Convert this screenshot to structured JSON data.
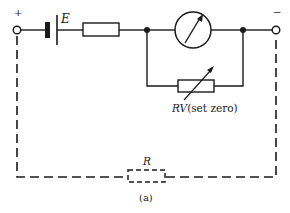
{
  "diagram": {
    "type": "circuit-schematic",
    "caption": "(a)",
    "terminals": {
      "positive": {
        "label": "+",
        "x": 17,
        "y": 30
      },
      "negative": {
        "label": "−",
        "x": 276,
        "y": 30
      }
    },
    "components": {
      "battery": {
        "label": "E",
        "symbol": "cell"
      },
      "series_resistor": {
        "label": "",
        "symbol": "resistor"
      },
      "meter": {
        "label": "",
        "symbol": "moving-coil-meter"
      },
      "variable_resistor": {
        "label_main": "RV",
        "label_note": "(set zero)",
        "symbol": "variable-resistor"
      },
      "unknown_resistor": {
        "label": "R",
        "symbol": "resistor-dashed"
      }
    },
    "colors": {
      "ink": "#1a1a1a",
      "background": "#ffffff"
    }
  }
}
